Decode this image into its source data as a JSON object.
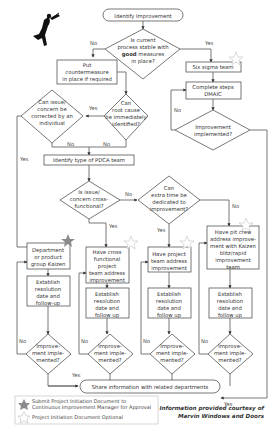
{
  "start": "Identify Improvement",
  "q_stable": [
    "Is current",
    "process stable with",
    "good measures",
    "in place?"
  ],
  "q_stable_bold_word": "good",
  "countermeasure": [
    "Put",
    "countermeasure",
    "in place if required"
  ],
  "six_sigma": "Six sigma team",
  "dmaic": [
    "Complete steps",
    "DMAIC"
  ],
  "q_root": [
    "Can",
    "root cause",
    "be immediately",
    "identified?"
  ],
  "q_individual": [
    "Can issue/",
    "concern be",
    "corrected by an",
    "individual"
  ],
  "q_impl_ss": [
    "Improvement",
    "implemented?"
  ],
  "pdca": "Identify type of PDCA team",
  "q_cross": [
    "Is issue/",
    "concern cross-",
    "functional?"
  ],
  "q_extra": [
    "Can",
    "extra time be",
    "dedicated to",
    "improvement?"
  ],
  "col1_box": [
    "Department",
    "or product",
    "group Kaizen"
  ],
  "col2_box": [
    "Have cross",
    "functional",
    "project",
    "team address",
    "improvement"
  ],
  "col3_box": [
    "Have project",
    "team address",
    "improvement"
  ],
  "col4_box": [
    "Have pit crew",
    "address improve-",
    "ment with Kaizen",
    "blitz/rapid",
    "improvement",
    "team"
  ],
  "establish_1": [
    "Establish",
    "resolution",
    "date and",
    "follow-up"
  ],
  "establish_2": [
    "Establish",
    "resolution",
    "date and",
    "follow up"
  ],
  "q_impl_small": [
    "Improve-",
    "ment imple-",
    "mented?"
  ],
  "share": "Share information with related departments",
  "labels": {
    "yes": "Yes",
    "no": "No"
  },
  "legend": {
    "filled_star": [
      "Submit Project Initiation Document to",
      "Continuous Improvement Manager for Approval"
    ],
    "outline_star": "Project Initiation Document Optional"
  },
  "credit": [
    "Information provided courtesy of",
    "Marvin Windows and Doors"
  ],
  "colors": {
    "line": "#555555",
    "filled_star": "#8a8a8a",
    "outline_star": "#cfcfcf"
  }
}
